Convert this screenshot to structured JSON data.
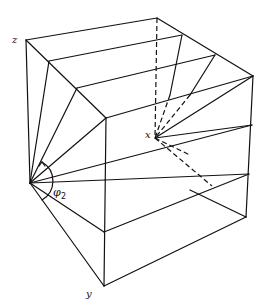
{
  "figure": {
    "type": "3D wireframe diagram",
    "labels": {
      "z_axis": "z",
      "y_axis": "y",
      "x_point": "x",
      "angle_symbol": "φ",
      "angle_subscript": "2"
    },
    "colors": {
      "line": "#111111",
      "background": "#ffffff"
    }
  }
}
